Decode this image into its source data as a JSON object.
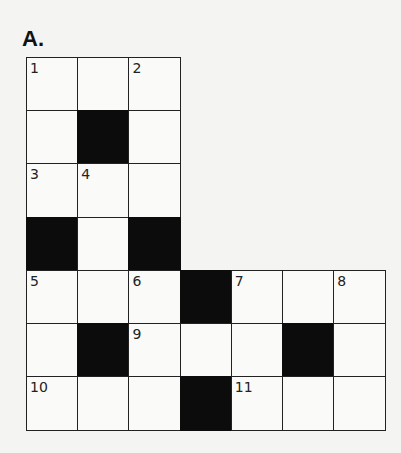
{
  "puzzle": {
    "label": "A.",
    "rows": 7,
    "cols": 7,
    "cell_width": 51.2,
    "cell_height": 53.2,
    "colors": {
      "white": "#fafaf8",
      "black": "#0c0c0c",
      "line": "#222222"
    },
    "cells": [
      {
        "r": 0,
        "c": 0,
        "type": "white",
        "num": "1"
      },
      {
        "r": 0,
        "c": 1,
        "type": "white",
        "num": ""
      },
      {
        "r": 0,
        "c": 2,
        "type": "white",
        "num": "2"
      },
      {
        "r": 1,
        "c": 0,
        "type": "white",
        "num": ""
      },
      {
        "r": 1,
        "c": 1,
        "type": "black",
        "num": ""
      },
      {
        "r": 1,
        "c": 2,
        "type": "white",
        "num": ""
      },
      {
        "r": 2,
        "c": 0,
        "type": "white",
        "num": "3"
      },
      {
        "r": 2,
        "c": 1,
        "type": "white",
        "num": "4"
      },
      {
        "r": 2,
        "c": 2,
        "type": "white",
        "num": ""
      },
      {
        "r": 3,
        "c": 0,
        "type": "black",
        "num": ""
      },
      {
        "r": 3,
        "c": 1,
        "type": "white",
        "num": ""
      },
      {
        "r": 3,
        "c": 2,
        "type": "black",
        "num": ""
      },
      {
        "r": 4,
        "c": 0,
        "type": "white",
        "num": "5"
      },
      {
        "r": 4,
        "c": 1,
        "type": "white",
        "num": ""
      },
      {
        "r": 4,
        "c": 2,
        "type": "white",
        "num": "6"
      },
      {
        "r": 4,
        "c": 3,
        "type": "black",
        "num": ""
      },
      {
        "r": 4,
        "c": 4,
        "type": "white",
        "num": "7"
      },
      {
        "r": 4,
        "c": 5,
        "type": "white",
        "num": ""
      },
      {
        "r": 4,
        "c": 6,
        "type": "white",
        "num": "8"
      },
      {
        "r": 5,
        "c": 0,
        "type": "white",
        "num": ""
      },
      {
        "r": 5,
        "c": 1,
        "type": "black",
        "num": ""
      },
      {
        "r": 5,
        "c": 2,
        "type": "white",
        "num": "9"
      },
      {
        "r": 5,
        "c": 3,
        "type": "white",
        "num": ""
      },
      {
        "r": 5,
        "c": 4,
        "type": "white",
        "num": ""
      },
      {
        "r": 5,
        "c": 5,
        "type": "black",
        "num": ""
      },
      {
        "r": 5,
        "c": 6,
        "type": "white",
        "num": ""
      },
      {
        "r": 6,
        "c": 0,
        "type": "white",
        "num": "10"
      },
      {
        "r": 6,
        "c": 1,
        "type": "white",
        "num": ""
      },
      {
        "r": 6,
        "c": 2,
        "type": "white",
        "num": ""
      },
      {
        "r": 6,
        "c": 3,
        "type": "black",
        "num": ""
      },
      {
        "r": 6,
        "c": 4,
        "type": "white",
        "num": "11"
      },
      {
        "r": 6,
        "c": 5,
        "type": "white",
        "num": ""
      },
      {
        "r": 6,
        "c": 6,
        "type": "white",
        "num": ""
      }
    ]
  }
}
